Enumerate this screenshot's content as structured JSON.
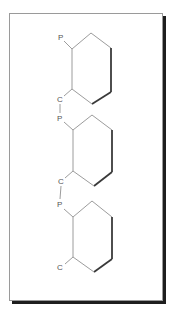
{
  "diagram": {
    "type": "chemical-structure",
    "colors": {
      "thin_bond": "#9c9c9c",
      "bold_bond": "#3a3a3a",
      "label": "#555555",
      "frame_border": "#9a9a9a",
      "frame_shadow": "#1e1e1e"
    },
    "rings": [
      {
        "id": "ring-1",
        "top_label": "P",
        "bottom_label": "C"
      },
      {
        "id": "ring-2",
        "top_label": "P",
        "bottom_label": "C"
      },
      {
        "id": "ring-3",
        "top_label": "P",
        "bottom_label": "C"
      }
    ],
    "links": [
      {
        "from": "ring-1.C",
        "to": "ring-2.P",
        "label": "C–P"
      },
      {
        "from": "ring-2.C",
        "to": "ring-3.P",
        "label": "C–P"
      }
    ]
  }
}
